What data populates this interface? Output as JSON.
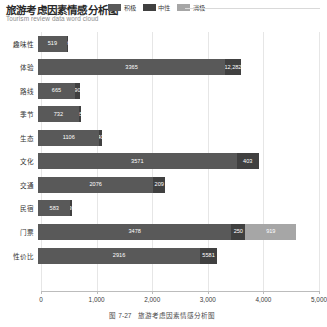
{
  "header": {
    "title": "旅游考虑因素情感分析图",
    "subtitle": "Tourism review data word cloud"
  },
  "caption": {
    "number": "图 7-27",
    "text": "旅游考虑因素情感分析图"
  },
  "colors": {
    "positive": "#595959",
    "neutral": "#404040",
    "negative": "#a6a6a6",
    "grid": "#e6e6e6",
    "axis": "#bcbcbc"
  },
  "chart_data": {
    "type": "bar",
    "orientation": "horizontal",
    "stacked": true,
    "title": "旅游考虑因素情感分析图",
    "subtitle": "Tourism review data word cloud",
    "xlabel": "",
    "ylabel": "",
    "xlim": [
      0,
      5000
    ],
    "xticks": [
      0,
      1000,
      2000,
      3000,
      4000,
      5000
    ],
    "xtick_labels": [
      "0",
      "1,000",
      "2,000",
      "3,000",
      "4,000",
      "5,000"
    ],
    "grid": true,
    "legend_position": "top-right",
    "categories": [
      "趣味性",
      "体验",
      "路线",
      "季节",
      "生态",
      "文化",
      "交通",
      "民宿",
      "门票",
      "性价比"
    ],
    "series": [
      {
        "name": "积极",
        "color": "#595959",
        "values": [
          519,
          3365,
          665,
          732,
          1106,
          3571,
          2076,
          583,
          3478,
          2916
        ]
      },
      {
        "name": "中性",
        "color": "#404040",
        "values": [
          20,
          282,
          90,
          35,
          40,
          403,
          209,
          30,
          250,
          303
        ]
      },
      {
        "name": "消极",
        "color": "#a6a6a6",
        "values": [
          0,
          0,
          0,
          0,
          0,
          0,
          0,
          0,
          919,
          0
        ]
      }
    ],
    "bar_labels": [
      {
        "category": "趣味性",
        "labels": [
          "519",
          "20",
          ""
        ]
      },
      {
        "category": "体验",
        "labels": [
          "3365",
          "12,282",
          ""
        ]
      },
      {
        "category": "路线",
        "labels": [
          "665",
          "90",
          ""
        ]
      },
      {
        "category": "季节",
        "labels": [
          "732",
          "35",
          ""
        ]
      },
      {
        "category": "生态",
        "labels": [
          "1106",
          "40",
          ""
        ]
      },
      {
        "category": "文化",
        "labels": [
          "3571",
          "403",
          ""
        ]
      },
      {
        "category": "交通",
        "labels": [
          "2076",
          "209",
          ""
        ]
      },
      {
        "category": "民宿",
        "labels": [
          "583",
          "30",
          ""
        ]
      },
      {
        "category": "门票",
        "labels": [
          "3478",
          "250",
          "919"
        ]
      },
      {
        "category": "性价比",
        "labels": [
          "2916",
          "5581",
          ""
        ]
      }
    ]
  }
}
